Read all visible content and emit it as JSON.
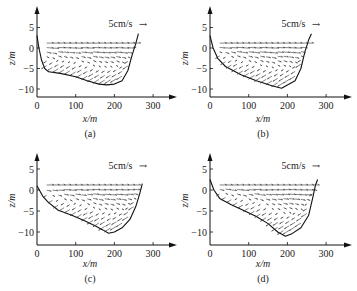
{
  "chart_data": [
    {
      "id": "a",
      "type": "quiver",
      "subfigure_label": "(a)",
      "xlabel": "x/m",
      "ylabel": "z/m",
      "xticks": [
        0,
        100,
        200,
        300
      ],
      "yticks": [
        5,
        0,
        -5,
        -10
      ],
      "xlim": [
        0,
        330
      ],
      "ylim": [
        -12,
        9
      ],
      "scale_label": "5cm/s",
      "surface_z": 1.2,
      "bed_profile": [
        [
          0,
          3
        ],
        [
          5,
          0
        ],
        [
          12,
          -3
        ],
        [
          20,
          -5
        ],
        [
          30,
          -5.8
        ],
        [
          60,
          -6.2
        ],
        [
          100,
          -7
        ],
        [
          130,
          -8
        ],
        [
          160,
          -8.8
        ],
        [
          180,
          -9
        ],
        [
          200,
          -8.8
        ],
        [
          220,
          -8
        ],
        [
          235,
          -5.5
        ],
        [
          245,
          -2
        ],
        [
          255,
          1
        ],
        [
          262,
          3.5
        ]
      ],
      "flow_pattern": "surface flow toward +x, return flow near bed toward -x"
    },
    {
      "id": "b",
      "type": "quiver",
      "subfigure_label": "(b)",
      "xlabel": "x/m",
      "ylabel": "z/m",
      "xticks": [
        0,
        100,
        200,
        300
      ],
      "yticks": [
        5,
        0,
        -5,
        -10
      ],
      "xlim": [
        0,
        330
      ],
      "ylim": [
        -12,
        9
      ],
      "scale_label": "5cm/s",
      "surface_z": 1.2,
      "bed_profile": [
        [
          0,
          3
        ],
        [
          8,
          0
        ],
        [
          20,
          -2.5
        ],
        [
          40,
          -4.5
        ],
        [
          80,
          -6.5
        ],
        [
          120,
          -8
        ],
        [
          160,
          -9.2
        ],
        [
          185,
          -9.8
        ],
        [
          200,
          -9
        ],
        [
          220,
          -8
        ],
        [
          235,
          -5
        ],
        [
          245,
          -1
        ],
        [
          255,
          2
        ],
        [
          262,
          3.5
        ]
      ],
      "flow_pattern": "surface flow toward +x, return flow near bed toward -x"
    },
    {
      "id": "c",
      "type": "quiver",
      "subfigure_label": "(c)",
      "xlabel": "x/m",
      "ylabel": "z/m",
      "xticks": [
        0,
        100,
        200,
        300
      ],
      "yticks": [
        5,
        0,
        -5,
        -10
      ],
      "xlim": [
        0,
        330
      ],
      "ylim": [
        -13,
        9
      ],
      "scale_label": "5cm/s",
      "surface_z": 1.2,
      "bed_profile": [
        [
          0,
          1
        ],
        [
          15,
          -1.5
        ],
        [
          30,
          -3
        ],
        [
          55,
          -4.8
        ],
        [
          90,
          -6
        ],
        [
          120,
          -7.2
        ],
        [
          150,
          -8.5
        ],
        [
          170,
          -9.5
        ],
        [
          185,
          -10.3
        ],
        [
          200,
          -10
        ],
        [
          220,
          -9
        ],
        [
          240,
          -7
        ],
        [
          255,
          -4
        ],
        [
          265,
          -1
        ],
        [
          272,
          1.5
        ]
      ],
      "flow_pattern": "surface flow toward +x, return flow near bed toward -x"
    },
    {
      "id": "d",
      "type": "quiver",
      "subfigure_label": "(d)",
      "xlabel": "x/m",
      "ylabel": "z/m",
      "xticks": [
        0,
        100,
        200,
        300
      ],
      "yticks": [
        5,
        0,
        -5,
        -10
      ],
      "xlim": [
        0,
        330
      ],
      "ylim": [
        -13,
        9
      ],
      "scale_label": "5cm/s",
      "surface_z": 1.2,
      "bed_profile": [
        [
          0,
          2.5
        ],
        [
          10,
          0
        ],
        [
          25,
          -2
        ],
        [
          55,
          -3.5
        ],
        [
          90,
          -5
        ],
        [
          120,
          -6.3
        ],
        [
          150,
          -8
        ],
        [
          175,
          -10
        ],
        [
          195,
          -11
        ],
        [
          210,
          -10.5
        ],
        [
          235,
          -9
        ],
        [
          255,
          -6
        ],
        [
          265,
          -2
        ],
        [
          272,
          1
        ],
        [
          278,
          2.5
        ]
      ],
      "flow_pattern": "surface flow toward +x, return flow near bed toward -x"
    }
  ]
}
